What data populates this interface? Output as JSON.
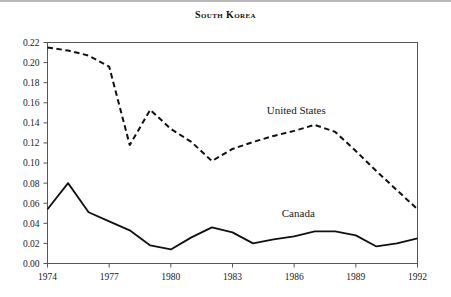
{
  "header": {
    "title": "South Korea"
  },
  "chart_data": {
    "type": "line",
    "title": "South Korea",
    "xlabel": "",
    "ylabel": "",
    "xlim": [
      1974,
      1992
    ],
    "ylim": [
      0.0,
      0.22
    ],
    "grid": false,
    "legend_position": "inline-annotation",
    "x": [
      1974,
      1975,
      1976,
      1977,
      1978,
      1979,
      1980,
      1981,
      1982,
      1983,
      1984,
      1985,
      1986,
      1987,
      1988,
      1989,
      1990,
      1991,
      1992
    ],
    "xticks": [
      1974,
      1977,
      1980,
      1983,
      1986,
      1989,
      1992
    ],
    "xtick_labels": [
      "1974",
      "1977",
      "1980",
      "1983",
      "1986",
      "1989",
      "1992"
    ],
    "yticks": [
      0.0,
      0.02,
      0.04,
      0.06,
      0.08,
      0.1,
      0.12,
      0.14,
      0.16,
      0.18,
      0.2,
      0.22
    ],
    "ytick_labels": [
      "0.00",
      "0.02",
      "0.04",
      "0.06",
      "0.08",
      "0.10",
      "0.12",
      "0.14",
      "0.16",
      "0.18",
      "0.20",
      "0.22"
    ],
    "series": [
      {
        "name": "United States",
        "style": "dashed",
        "color": "#111111",
        "label_x": 1986.1,
        "label_y": 0.149,
        "values": [
          0.215,
          0.212,
          0.207,
          0.196,
          0.118,
          0.153,
          0.134,
          0.121,
          0.102,
          0.114,
          0.121,
          0.127,
          0.132,
          0.138,
          0.131,
          0.112,
          0.092,
          0.073,
          0.054
        ]
      },
      {
        "name": "Canada",
        "style": "solid",
        "color": "#111111",
        "label_x": 1986.2,
        "label_y": 0.046,
        "values": [
          0.054,
          0.08,
          0.051,
          0.042,
          0.033,
          0.018,
          0.014,
          0.026,
          0.036,
          0.031,
          0.02,
          0.024,
          0.027,
          0.032,
          0.032,
          0.028,
          0.017,
          0.02,
          0.025
        ]
      }
    ]
  }
}
